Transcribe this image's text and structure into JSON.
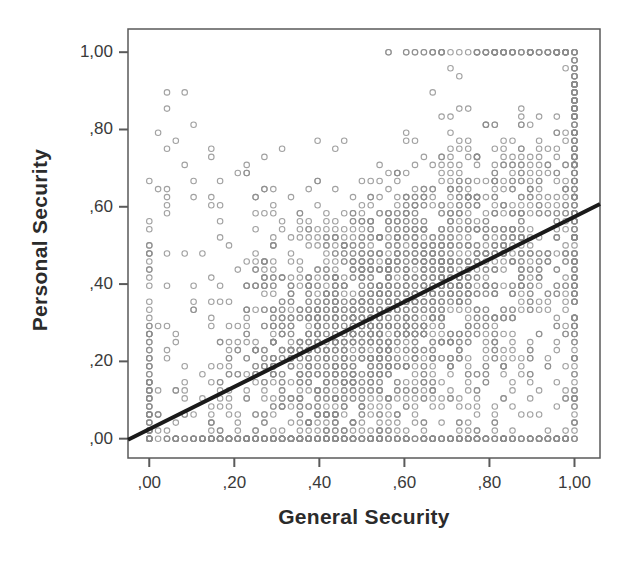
{
  "chart_data": {
    "type": "scatter",
    "title": "",
    "xlabel": "General Security",
    "ylabel": "Personal Security",
    "xlim": [
      -0.05,
      1.06
    ],
    "ylim": [
      -0.05,
      1.06
    ],
    "xticks": [
      0.0,
      0.2,
      0.4,
      0.6,
      0.8,
      1.0
    ],
    "yticks": [
      0.0,
      0.2,
      0.4,
      0.6,
      0.8,
      1.0
    ],
    "xtick_labels": [
      ",00",
      ",20",
      ",40",
      ",60",
      ",80",
      "1,00"
    ],
    "ytick_labels": [
      ",00",
      ",20",
      ",40",
      ",60",
      ",80",
      "1,00"
    ],
    "grid": false,
    "legend": null,
    "marker": {
      "shape": "open-circle",
      "color": "#8c8c8c",
      "size_px": 5.5,
      "stroke_width_px": 1.1
    },
    "fit_line": {
      "type": "linear",
      "color": "#1a1a1a",
      "width_px": 4,
      "x_start": -0.05,
      "y_start": -0.003,
      "x_end": 1.06,
      "y_end": 0.607,
      "slope": 0.55,
      "intercept": 0.0245
    },
    "frame": {
      "color": "#5a5a5a",
      "width_px": 1.5,
      "left_px": 128,
      "top_px": 29,
      "right_px": 600,
      "bottom_px": 458
    },
    "n_points_approx": 3000,
    "relationship": "positive moderate correlation; dense lattice of discrete survey-index values, heaviest mass in upper-right quadrant, with saturated rows at y=,00 and columns at x=,00 and x=1,00",
    "axis_decimal_separator": "comma"
  },
  "axes": {
    "x_title": "General Security",
    "y_title": "Personal Security"
  }
}
